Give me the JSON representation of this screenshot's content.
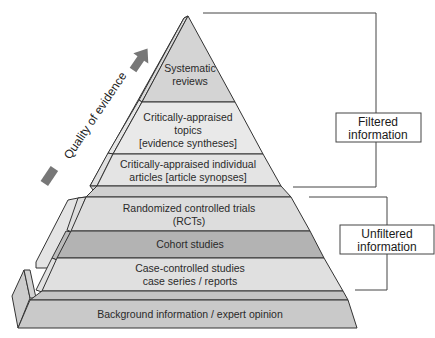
{
  "diagram": {
    "type": "evidence-pyramid",
    "axis_label": "Quality of evidence",
    "tiers": [
      {
        "id": "systematic",
        "lines": [
          "Systematic",
          "reviews"
        ],
        "color": "#d4d4d4"
      },
      {
        "id": "topics",
        "lines": [
          "Critically-appraised",
          "topics",
          "[evidence syntheses]"
        ],
        "color": "#e8e8e8"
      },
      {
        "id": "articles",
        "lines": [
          "Critically-appraised individual",
          "articles [article synopses]"
        ],
        "color": "#e4e4e4"
      },
      {
        "id": "rcts",
        "lines": [
          "Randomized controlled trials",
          "(RCTs)"
        ],
        "color": "#dedede"
      },
      {
        "id": "cohort",
        "lines": [
          "Cohort studies"
        ],
        "color": "#b4b4b4"
      },
      {
        "id": "case",
        "lines": [
          "Case-controlled studies",
          "case series / reports"
        ],
        "color": "#e0e0e0"
      },
      {
        "id": "background",
        "lines": [
          "Background information / expert opinion"
        ],
        "color": "#c8c8c8"
      }
    ],
    "groups": [
      {
        "id": "filtered",
        "lines": [
          "Filtered",
          "information"
        ]
      },
      {
        "id": "unfiltered",
        "lines": [
          "Unfiltered",
          "information"
        ]
      }
    ],
    "arrow_color": "#777777",
    "outline_color": "#333333"
  }
}
